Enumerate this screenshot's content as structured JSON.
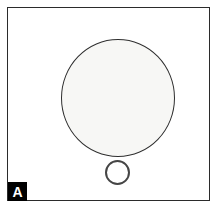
{
  "figure": {
    "panel_label": "A",
    "background_color": "#ffffff",
    "frame": {
      "border_color": "#2b2b2b",
      "fill_color": "#ffffff"
    },
    "label_box": {
      "background_color": "#000000",
      "text_color": "#ffffff"
    },
    "objects": {
      "large_circle": {
        "name": "large-circle",
        "fill_color": "#f7f7f5",
        "outline_color": "#2e2e2e"
      },
      "small_ring": {
        "name": "small-ring",
        "fill_color": "#ffffff",
        "outline_color": "#454545"
      }
    }
  }
}
